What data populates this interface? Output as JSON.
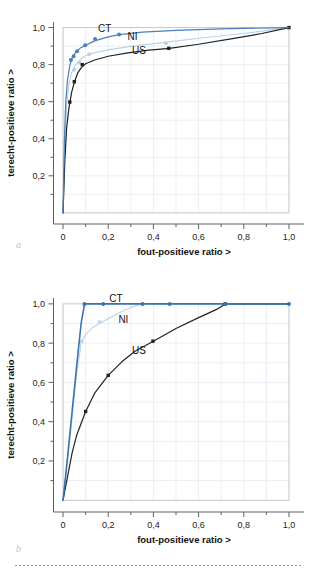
{
  "figure": {
    "background": "#ffffff",
    "panel_letters": {
      "a": "a",
      "b": "b"
    },
    "letter_color": "#aac4e0",
    "footer_rule": "dotted"
  },
  "axes": {
    "xlabel": "fout-positieve ratio >",
    "ylabel": "terecht-positieve ratio >",
    "xticks": [
      "0",
      "0,2",
      "0,4",
      "0,6",
      "0,8",
      "1,0"
    ],
    "xtick_values": [
      0,
      0.2,
      0.4,
      0.6,
      0.8,
      1.0
    ],
    "yticks": [
      "0,2",
      "0,4",
      "0,6",
      "0,8",
      "1,0"
    ],
    "ytick_values": [
      0.2,
      0.4,
      0.6,
      0.8,
      1.0
    ],
    "xlim": [
      -0.04,
      1.04
    ],
    "ylim": [
      -0.06,
      1.03
    ],
    "grid": true,
    "grid_color": "#dfe6ef",
    "axis_color": "#5a5a5a"
  },
  "legend_labels": {
    "ct": "CT",
    "ni": "NI",
    "us": "US"
  },
  "colors": {
    "ct": "#4a80b8",
    "ni": "#b9d4ea",
    "us": "#222222",
    "grid": "#e1e8f0",
    "axis": "#606060",
    "letter": "#a9c3df"
  },
  "chart_data": [
    {
      "id": "a",
      "type": "line",
      "title": "",
      "xlabel": "fout-positieve ratio >",
      "ylabel": "terecht-positieve ratio >",
      "xlim": [
        0,
        1
      ],
      "ylim": [
        0,
        1
      ],
      "grid": true,
      "legend": "inline-annotations",
      "annotations": [
        {
          "text": "CT",
          "x": 0.155,
          "y": 0.975
        },
        {
          "text": "NI",
          "x": 0.285,
          "y": 0.935
        },
        {
          "text": "US",
          "x": 0.305,
          "y": 0.855
        }
      ],
      "series": [
        {
          "name": "CT",
          "color": "#4a80b8",
          "curve": [
            [
              0.0,
              0.0
            ],
            [
              0.006,
              0.4
            ],
            [
              0.012,
              0.6
            ],
            [
              0.02,
              0.72
            ],
            [
              0.03,
              0.795
            ],
            [
              0.04,
              0.835
            ],
            [
              0.055,
              0.865
            ],
            [
              0.075,
              0.888
            ],
            [
              0.1,
              0.905
            ],
            [
              0.14,
              0.928
            ],
            [
              0.2,
              0.95
            ],
            [
              0.25,
              0.962
            ],
            [
              0.35,
              0.975
            ],
            [
              0.5,
              0.985
            ],
            [
              0.7,
              0.993
            ],
            [
              1.0,
              1.0
            ]
          ],
          "markers": [
            [
              0.035,
              0.825
            ],
            [
              0.047,
              0.845
            ],
            [
              0.062,
              0.872
            ],
            [
              0.098,
              0.905
            ],
            [
              0.142,
              0.938
            ],
            [
              0.248,
              0.962
            ]
          ]
        },
        {
          "name": "NI",
          "color": "#b9d4ea",
          "curve": [
            [
              0.0,
              0.0
            ],
            [
              0.008,
              0.38
            ],
            [
              0.016,
              0.58
            ],
            [
              0.026,
              0.695
            ],
            [
              0.038,
              0.755
            ],
            [
              0.05,
              0.79
            ],
            [
              0.07,
              0.82
            ],
            [
              0.095,
              0.845
            ],
            [
              0.13,
              0.862
            ],
            [
              0.2,
              0.88
            ],
            [
              0.3,
              0.898
            ],
            [
              0.45,
              0.92
            ],
            [
              0.62,
              0.945
            ],
            [
              0.8,
              0.968
            ],
            [
              1.0,
              1.0
            ]
          ],
          "markers": [
            [
              0.05,
              0.772
            ],
            [
              0.072,
              0.812
            ],
            [
              0.116,
              0.856
            ],
            [
              0.455,
              0.915
            ]
          ]
        },
        {
          "name": "US",
          "color": "#222222",
          "curve": [
            [
              0.0,
              0.0
            ],
            [
              0.008,
              0.28
            ],
            [
              0.016,
              0.46
            ],
            [
              0.026,
              0.565
            ],
            [
              0.038,
              0.65
            ],
            [
              0.05,
              0.705
            ],
            [
              0.065,
              0.755
            ],
            [
              0.082,
              0.785
            ],
            [
              0.1,
              0.805
            ],
            [
              0.14,
              0.825
            ],
            [
              0.2,
              0.845
            ],
            [
              0.28,
              0.862
            ],
            [
              0.38,
              0.878
            ],
            [
              0.47,
              0.888
            ],
            [
              0.6,
              0.91
            ],
            [
              0.75,
              0.94
            ],
            [
              0.88,
              0.968
            ],
            [
              1.0,
              1.0
            ]
          ],
          "markers": [
            [
              0.03,
              0.598
            ],
            [
              0.05,
              0.708
            ],
            [
              0.085,
              0.8
            ],
            [
              0.468,
              0.888
            ],
            [
              1.0,
              1.0
            ]
          ]
        }
      ]
    },
    {
      "id": "b",
      "type": "line",
      "title": "",
      "xlabel": "fout-positieve ratio >",
      "ylabel": "terecht-positieve ratio >",
      "xlim": [
        0,
        1
      ],
      "ylim": [
        0,
        1
      ],
      "grid": true,
      "legend": "inline-annotations",
      "annotations": [
        {
          "text": "CT",
          "x": 0.205,
          "y": 1.01
        },
        {
          "text": "NI",
          "x": 0.245,
          "y": 0.905
        },
        {
          "text": "US",
          "x": 0.305,
          "y": 0.745
        }
      ],
      "series": [
        {
          "name": "CT",
          "color": "#3a74ae",
          "curve": [
            [
              0.0,
              0.0
            ],
            [
              0.02,
              0.22
            ],
            [
              0.04,
              0.45
            ],
            [
              0.06,
              0.68
            ],
            [
              0.08,
              0.9
            ],
            [
              0.095,
              1.0
            ],
            [
              0.18,
              1.0
            ],
            [
              0.35,
              1.0
            ],
            [
              0.47,
              1.0
            ],
            [
              0.72,
              1.0
            ],
            [
              1.0,
              1.0
            ]
          ],
          "markers": [
            [
              0.095,
              1.0
            ],
            [
              0.178,
              1.0
            ],
            [
              0.352,
              1.0
            ],
            [
              0.472,
              1.0
            ],
            [
              0.718,
              1.0
            ],
            [
              1.0,
              1.0
            ]
          ]
        },
        {
          "name": "NI",
          "color": "#bcd7ec",
          "curve": [
            [
              0.0,
              0.0
            ],
            [
              0.02,
              0.2
            ],
            [
              0.04,
              0.42
            ],
            [
              0.06,
              0.64
            ],
            [
              0.08,
              0.8
            ],
            [
              0.1,
              0.845
            ],
            [
              0.13,
              0.878
            ],
            [
              0.16,
              0.9
            ],
            [
              0.2,
              0.925
            ],
            [
              0.25,
              0.955
            ],
            [
              0.3,
              0.982
            ],
            [
              0.352,
              1.0
            ],
            [
              0.5,
              1.0
            ],
            [
              0.75,
              1.0
            ],
            [
              1.0,
              1.0
            ]
          ],
          "markers": [
            [
              0.082,
              0.808
            ],
            [
              0.162,
              0.908
            ],
            [
              0.352,
              1.0
            ]
          ]
        },
        {
          "name": "US",
          "color": "#222222",
          "curve": [
            [
              0.0,
              0.0
            ],
            [
              0.02,
              0.12
            ],
            [
              0.04,
              0.24
            ],
            [
              0.06,
              0.33
            ],
            [
              0.1,
              0.452
            ],
            [
              0.14,
              0.545
            ],
            [
              0.2,
              0.636
            ],
            [
              0.26,
              0.705
            ],
            [
              0.32,
              0.76
            ],
            [
              0.4,
              0.81
            ],
            [
              0.5,
              0.875
            ],
            [
              0.6,
              0.93
            ],
            [
              0.68,
              0.972
            ],
            [
              0.718,
              1.0
            ],
            [
              0.85,
              1.0
            ],
            [
              1.0,
              1.0
            ]
          ],
          "markers": [
            [
              0.1,
              0.452
            ],
            [
              0.2,
              0.636
            ],
            [
              0.398,
              0.81
            ],
            [
              0.718,
              1.0
            ]
          ]
        }
      ]
    }
  ]
}
